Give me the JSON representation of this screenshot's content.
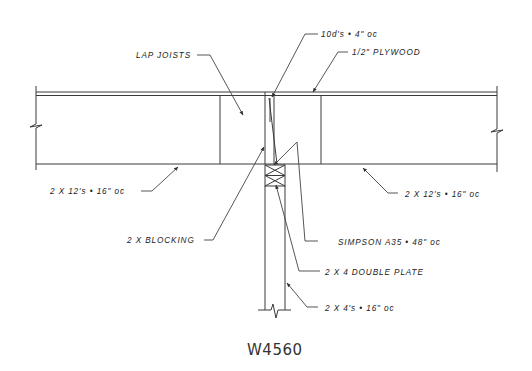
{
  "drawing": {
    "id": "W4560",
    "background": "#ffffff",
    "line_color": "#3a3a3a"
  },
  "labels": {
    "nails": "10d's • 4\" oc",
    "plywood": "1/2\" PLYWOOD",
    "lap_joists": "LAP JOISTS",
    "joists_left": "2 X 12's • 16\" oc",
    "joists_right": "2 X 12's • 16\" oc",
    "blocking": "2 X BLOCKING",
    "clip": "SIMPSON A35 • 48\" oc",
    "double_plate": "2 X 4 DOUBLE PLATE",
    "studs": "2 X 4's • 16\" oc"
  }
}
